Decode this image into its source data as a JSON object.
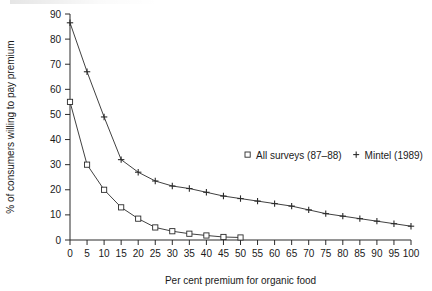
{
  "chart_data": {
    "type": "line",
    "title": "",
    "xlabel": "Per cent premium for organic food",
    "ylabel": "% of consumers willing to pay premium",
    "xlim": [
      0,
      100
    ],
    "ylim": [
      0,
      90
    ],
    "xticks": [
      0,
      5,
      10,
      15,
      20,
      25,
      30,
      35,
      40,
      45,
      50,
      55,
      60,
      65,
      70,
      75,
      80,
      85,
      90,
      95,
      100
    ],
    "yticks": [
      0,
      10,
      20,
      30,
      40,
      50,
      60,
      70,
      80,
      90
    ],
    "grid": false,
    "legend_position": "center-right",
    "series": [
      {
        "name": "All surveys (87–88)",
        "marker": "square",
        "x": [
          0,
          5,
          10,
          15,
          20,
          25,
          30,
          35,
          40,
          45,
          50
        ],
        "values": [
          55,
          30,
          20,
          13,
          8.5,
          5,
          3.5,
          2.5,
          1.8,
          1.2,
          1
        ]
      },
      {
        "name": "Mintel (1989)",
        "marker": "plus",
        "x": [
          0,
          5,
          10,
          15,
          20,
          25,
          30,
          35,
          40,
          45,
          50,
          55,
          60,
          65,
          70,
          75,
          80,
          85,
          90,
          95,
          100
        ],
        "values": [
          86.5,
          67,
          49,
          32,
          27,
          23.5,
          21.5,
          20.5,
          19,
          17.5,
          16.5,
          15.5,
          14.5,
          13.5,
          12,
          10.5,
          9.5,
          8.5,
          7.5,
          6.5,
          5.5
        ]
      }
    ]
  },
  "legend": {
    "entries": [
      {
        "marker_name": "legend-marker-square",
        "label": "All surveys (87–88)"
      },
      {
        "marker_name": "legend-marker-plus",
        "label": "Mintel (1989)"
      }
    ]
  },
  "colors": {
    "ink": "#2b2b2b",
    "background": "#ffffff"
  }
}
